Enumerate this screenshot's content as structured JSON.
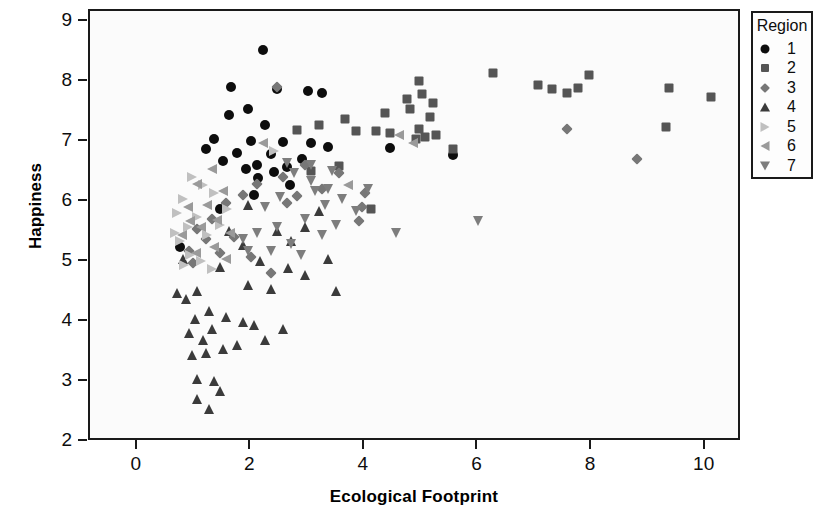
{
  "chart_data": {
    "type": "scatter",
    "title": "",
    "xlabel": "Ecological Footprint",
    "ylabel": "Happiness",
    "xlim": [
      -0.84,
      10.64
    ],
    "ylim": [
      2.0,
      9.18
    ],
    "xticks": [
      0,
      2,
      4,
      6,
      8,
      10
    ],
    "yticks": [
      2,
      3,
      4,
      5,
      6,
      7,
      8,
      9
    ],
    "grid": false,
    "legend": {
      "title": "Region",
      "position": "outside-top-right",
      "entries": [
        {
          "label": "1",
          "marker": "circle",
          "color": "#0d0d0d"
        },
        {
          "label": "2",
          "marker": "square",
          "color": "#555555"
        },
        {
          "label": "3",
          "marker": "diamond",
          "color": "#777777"
        },
        {
          "label": "4",
          "marker": "triangle-up",
          "color": "#3b3b3b"
        },
        {
          "label": "5",
          "marker": "triangle-right",
          "color": "#c0c0c0"
        },
        {
          "label": "6",
          "marker": "triangle-left",
          "color": "#9a9a9a"
        },
        {
          "label": "7",
          "marker": "triangle-down",
          "color": "#7d7d7d"
        }
      ]
    },
    "series": [
      {
        "name": "1",
        "marker": "circle",
        "color": "#0d0d0d",
        "points": [
          [
            2.2,
            8.53
          ],
          [
            1.65,
            7.92
          ],
          [
            2.45,
            7.88
          ],
          [
            3.0,
            7.85
          ],
          [
            3.25,
            7.82
          ],
          [
            1.95,
            7.55
          ],
          [
            1.6,
            7.45
          ],
          [
            2.25,
            7.28
          ],
          [
            1.35,
            7.05
          ],
          [
            2.0,
            7.02
          ],
          [
            2.55,
            7.0
          ],
          [
            3.05,
            6.98
          ],
          [
            1.2,
            6.88
          ],
          [
            1.75,
            6.82
          ],
          [
            2.35,
            6.8
          ],
          [
            5.55,
            6.78
          ],
          [
            2.9,
            6.72
          ],
          [
            1.5,
            6.68
          ],
          [
            2.1,
            6.62
          ],
          [
            2.62,
            6.58
          ],
          [
            1.9,
            6.55
          ],
          [
            2.4,
            6.5
          ],
          [
            1.45,
            5.88
          ],
          [
            2.05,
            6.12
          ],
          [
            0.75,
            5.25
          ],
          [
            2.12,
            6.4
          ],
          [
            2.68,
            6.28
          ],
          [
            3.35,
            6.92
          ],
          [
            4.45,
            6.9
          ]
        ]
      },
      {
        "name": "2",
        "marker": "square",
        "color": "#555555",
        "points": [
          [
            6.25,
            8.15
          ],
          [
            7.95,
            8.12
          ],
          [
            7.05,
            7.95
          ],
          [
            7.3,
            7.88
          ],
          [
            7.55,
            7.82
          ],
          [
            7.75,
            7.9
          ],
          [
            9.35,
            7.9
          ],
          [
            10.1,
            7.75
          ],
          [
            4.95,
            8.02
          ],
          [
            5.0,
            7.8
          ],
          [
            4.75,
            7.72
          ],
          [
            5.2,
            7.65
          ],
          [
            4.8,
            7.55
          ],
          [
            5.15,
            7.42
          ],
          [
            4.35,
            7.48
          ],
          [
            3.65,
            7.38
          ],
          [
            4.2,
            7.18
          ],
          [
            4.45,
            7.15
          ],
          [
            5.25,
            7.12
          ],
          [
            5.05,
            7.08
          ],
          [
            4.9,
            7.05
          ],
          [
            5.55,
            6.88
          ],
          [
            3.85,
            7.18
          ],
          [
            3.2,
            7.28
          ],
          [
            3.05,
            6.52
          ],
          [
            3.55,
            6.6
          ],
          [
            4.1,
            5.88
          ],
          [
            2.8,
            7.2
          ],
          [
            4.95,
            7.22
          ],
          [
            9.3,
            7.25
          ]
        ]
      },
      {
        "name": "3",
        "marker": "diamond",
        "color": "#777777",
        "points": [
          [
            2.45,
            7.92
          ],
          [
            2.95,
            6.62
          ],
          [
            2.55,
            6.42
          ],
          [
            2.1,
            6.3
          ],
          [
            1.85,
            6.12
          ],
          [
            1.55,
            5.98
          ],
          [
            1.3,
            5.72
          ],
          [
            1.05,
            5.55
          ],
          [
            1.2,
            5.38
          ],
          [
            0.9,
            5.18
          ],
          [
            1.7,
            5.42
          ],
          [
            2.0,
            5.08
          ],
          [
            2.35,
            4.82
          ],
          [
            2.8,
            6.1
          ],
          [
            3.25,
            6.22
          ],
          [
            3.55,
            6.48
          ],
          [
            4.0,
            6.15
          ],
          [
            3.95,
            5.92
          ],
          [
            3.9,
            5.68
          ],
          [
            8.8,
            6.72
          ],
          [
            7.55,
            7.22
          ],
          [
            1.45,
            5.15
          ],
          [
            0.98,
            4.98
          ],
          [
            2.62,
            5.98
          ]
        ]
      },
      {
        "name": "4",
        "marker": "triangle-up",
        "color": "#3b3b3b",
        "points": [
          [
            1.95,
            5.95
          ],
          [
            1.6,
            5.52
          ],
          [
            1.85,
            5.28
          ],
          [
            2.15,
            5.02
          ],
          [
            1.45,
            4.92
          ],
          [
            1.05,
            4.52
          ],
          [
            0.85,
            4.38
          ],
          [
            1.25,
            4.18
          ],
          [
            1.0,
            4.05
          ],
          [
            1.55,
            4.08
          ],
          [
            1.85,
            4.0
          ],
          [
            2.05,
            3.95
          ],
          [
            1.3,
            3.88
          ],
          [
            0.9,
            3.82
          ],
          [
            1.15,
            3.7
          ],
          [
            2.55,
            3.88
          ],
          [
            1.75,
            3.62
          ],
          [
            2.25,
            3.7
          ],
          [
            1.5,
            3.55
          ],
          [
            1.2,
            3.48
          ],
          [
            0.95,
            3.45
          ],
          [
            1.05,
            3.05
          ],
          [
            1.35,
            3.02
          ],
          [
            1.45,
            2.85
          ],
          [
            1.05,
            2.72
          ],
          [
            1.25,
            2.55
          ],
          [
            3.5,
            4.52
          ],
          [
            2.95,
            4.78
          ],
          [
            3.35,
            5.05
          ],
          [
            2.7,
            5.35
          ],
          [
            2.45,
            5.52
          ],
          [
            2.95,
            5.58
          ],
          [
            3.2,
            5.85
          ],
          [
            2.35,
            4.55
          ],
          [
            1.95,
            4.62
          ],
          [
            2.65,
            4.9
          ],
          [
            0.7,
            4.48
          ],
          [
            0.8,
            5.05
          ]
        ]
      },
      {
        "name": "5",
        "marker": "triangle-right",
        "color": "#c0c0c0",
        "points": [
          [
            0.95,
            6.42
          ],
          [
            1.15,
            6.28
          ],
          [
            0.8,
            6.05
          ],
          [
            1.35,
            6.15
          ],
          [
            0.7,
            5.82
          ],
          [
            1.05,
            5.75
          ],
          [
            0.88,
            5.58
          ],
          [
            1.22,
            5.45
          ],
          [
            0.75,
            5.35
          ],
          [
            1.45,
            5.62
          ],
          [
            1.58,
            5.88
          ],
          [
            0.92,
            5.12
          ],
          [
            1.12,
            5.02
          ],
          [
            1.3,
            4.88
          ],
          [
            2.4,
            6.85
          ],
          [
            0.65,
            5.48
          ],
          [
            0.82,
            4.95
          ]
        ]
      },
      {
        "name": "6",
        "marker": "triangle-left",
        "color": "#9a9a9a",
        "points": [
          [
            1.3,
            6.55
          ],
          [
            1.05,
            6.3
          ],
          [
            1.5,
            6.18
          ],
          [
            1.22,
            5.95
          ],
          [
            0.88,
            5.92
          ],
          [
            1.4,
            5.7
          ],
          [
            1.12,
            5.58
          ],
          [
            0.78,
            5.45
          ],
          [
            1.62,
            5.48
          ],
          [
            1.35,
            5.25
          ],
          [
            1.02,
            5.15
          ],
          [
            4.6,
            7.12
          ],
          [
            4.85,
            6.98
          ],
          [
            3.7,
            6.28
          ],
          [
            2.2,
            6.98
          ],
          [
            0.92,
            5.68
          ],
          [
            1.55,
            5.05
          ]
        ]
      },
      {
        "name": "7",
        "marker": "triangle-down",
        "color": "#7d7d7d",
        "points": [
          [
            2.75,
            6.48
          ],
          [
            3.05,
            6.35
          ],
          [
            3.35,
            6.22
          ],
          [
            2.5,
            6.08
          ],
          [
            2.25,
            5.92
          ],
          [
            3.6,
            6.05
          ],
          [
            3.85,
            5.85
          ],
          [
            2.95,
            5.72
          ],
          [
            2.45,
            5.58
          ],
          [
            2.1,
            5.48
          ],
          [
            1.85,
            5.38
          ],
          [
            3.3,
            5.95
          ],
          [
            3.5,
            5.62
          ],
          [
            3.25,
            5.45
          ],
          [
            2.7,
            5.3
          ],
          [
            2.35,
            5.18
          ],
          [
            4.55,
            5.48
          ],
          [
            6.0,
            5.68
          ],
          [
            3.05,
            6.62
          ],
          [
            3.12,
            6.18
          ],
          [
            1.95,
            5.18
          ],
          [
            2.62,
            6.65
          ],
          [
            4.05,
            6.22
          ],
          [
            3.42,
            6.52
          ],
          [
            2.88,
            5.12
          ]
        ]
      }
    ]
  }
}
